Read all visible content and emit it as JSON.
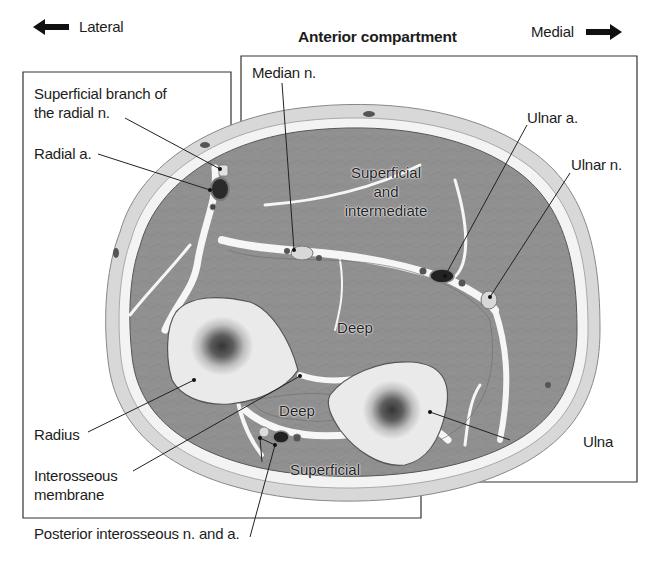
{
  "header": {
    "lateral_label": "Lateral",
    "medial_label": "Medial",
    "compartment_title": "Anterior compartment",
    "lateral_arrow_icon": "arrow-left-icon",
    "medial_arrow_icon": "arrow-right-icon"
  },
  "labels": {
    "superficial_branch_radial": "Superficial branch of\nthe radial n.",
    "radial_artery": "Radial a.",
    "median_nerve": "Median n.",
    "ulnar_artery": "Ulnar a.",
    "ulnar_nerve": "Ulnar n.",
    "radius": "Radius",
    "interosseous_membrane": "Interosseous\nmembrane",
    "posterior_interosseous": "Posterior interosseous n. and a.",
    "ulna": "Ulna"
  },
  "regions": {
    "anterior_superficial": "Superficial\nand\nintermediate",
    "anterior_deep": "Deep",
    "posterior_deep": "Deep",
    "posterior_superficial": "Superficial"
  },
  "colors": {
    "skin": "#d6d6d6",
    "fascia": "#f4f4f4",
    "muscle": "#8f8f8f",
    "bone": "#e9e9e9",
    "bone_marrow": "#3a3a3a",
    "vessel_dark": "#2a2a2a",
    "nerve": "#d9d9d9",
    "leader": "#222222"
  }
}
